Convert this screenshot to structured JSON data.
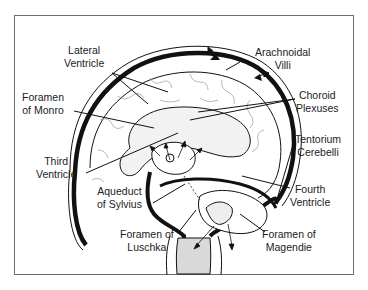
{
  "diagram": {
    "labels": {
      "lateral_ventricle": [
        "Lateral",
        "Ventricle"
      ],
      "foramen_of_monro": [
        "Foramen",
        "of Monro"
      ],
      "third_ventricle": [
        "Third",
        "Ventricle"
      ],
      "aqueduct_of_sylvius": [
        "Aqueduct",
        "of Sylvius"
      ],
      "foramen_of_luschka": [
        "Foramen of",
        "Luschka"
      ],
      "arachnoidal_villi": [
        "Arachnoidal",
        "Villi"
      ],
      "choroid_plexuses": [
        "Choroid",
        "Plexuses"
      ],
      "tentorium_cerebelli": [
        "Tentorium",
        "Cerebelli"
      ],
      "fourth_ventricle": [
        "Fourth",
        "Ventricle"
      ],
      "foramen_of_magendie": [
        "Foramen of",
        "Magendie"
      ]
    },
    "colors": {
      "ink": "#111111",
      "frame": "#6e6e6e",
      "fill_light": "#f1f1f1",
      "text": "#222222"
    }
  }
}
